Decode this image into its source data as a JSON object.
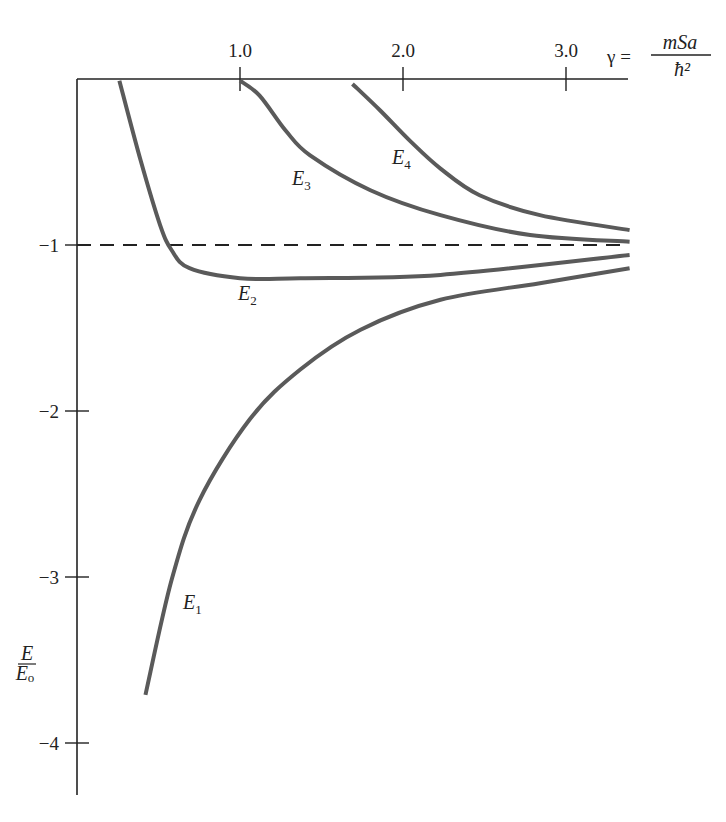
{
  "chart_data": {
    "type": "line",
    "title": "",
    "xlabel": "γ = mSa/ħ²",
    "xlabel_parts": {
      "lhs": "γ =",
      "numerator": "mSa",
      "denominator": "ħ²"
    },
    "ylabel": "E/Eo",
    "ylabel_parts": {
      "numerator": "E",
      "denominator": "E",
      "denominator_sub": "o"
    },
    "xlim": [
      0,
      3.4
    ],
    "ylim": [
      -4.3,
      0
    ],
    "x_axis_position": "top",
    "grid": false,
    "legend": "none (inline curve labels)",
    "x_ticks": [
      {
        "value": 1.0,
        "label": "1.0"
      },
      {
        "value": 2.0,
        "label": "2.0"
      },
      {
        "value": 3.0,
        "label": "3.0"
      }
    ],
    "y_ticks": [
      {
        "value": -1,
        "label": "−1"
      },
      {
        "value": -2,
        "label": "−2"
      },
      {
        "value": -3,
        "label": "−3"
      },
      {
        "value": -4,
        "label": "−4"
      }
    ],
    "reference_lines": [
      {
        "type": "horizontal",
        "y": -1,
        "style": "dashed"
      }
    ],
    "series": [
      {
        "name": "E1",
        "label": "E",
        "label_sub": "1",
        "x": [
          0.42,
          0.58,
          0.75,
          1.06,
          1.37,
          1.74,
          2.23,
          2.84,
          3.39
        ],
        "y": [
          -3.71,
          -3.02,
          -2.54,
          -2.05,
          -1.75,
          -1.51,
          -1.33,
          -1.23,
          -1.14
        ]
      },
      {
        "name": "E2",
        "label": "E",
        "label_sub": "2",
        "x": [
          0.26,
          0.39,
          0.51,
          0.58,
          0.69,
          1.0,
          1.37,
          2.23,
          3.39
        ],
        "y": [
          -0.01,
          -0.49,
          -0.88,
          -1.03,
          -1.14,
          -1.2,
          -1.2,
          -1.18,
          -1.06
        ]
      },
      {
        "name": "E3",
        "label": "E",
        "label_sub": "3",
        "x": [
          1.0,
          1.12,
          1.28,
          1.43,
          1.8,
          2.23,
          2.78,
          3.39
        ],
        "y": [
          -0.01,
          -0.1,
          -0.31,
          -0.46,
          -0.67,
          -0.82,
          -0.94,
          -0.98
        ]
      },
      {
        "name": "E4",
        "label": "E",
        "label_sub": "4",
        "x": [
          1.69,
          1.86,
          2.04,
          2.23,
          2.47,
          2.84,
          3.39
        ],
        "y": [
          -0.03,
          -0.19,
          -0.37,
          -0.54,
          -0.7,
          -0.82,
          -0.91
        ]
      }
    ]
  },
  "labels": {
    "gamma_lhs": "γ =",
    "gamma_num": "mSa",
    "gamma_den": "ħ²",
    "y_num": "E",
    "y_den": "E",
    "y_den_sub": "o"
  },
  "style": {
    "curve_color": "#5a5a5a",
    "axis_color": "#222222"
  }
}
